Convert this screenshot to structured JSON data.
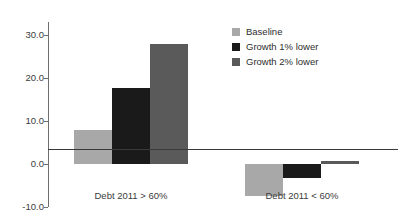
{
  "chart_data": {
    "type": "bar",
    "title": "",
    "subtitle": "",
    "xlabel": "",
    "ylabel": "",
    "categories": [
      "Debt 2011 > 60%",
      "Debt 2011 < 60%"
    ],
    "series": [
      {
        "name": "Baseline",
        "color": "#a8a8a8",
        "values": [
          8.0,
          -7.5
        ]
      },
      {
        "name": "Growth 1% lower",
        "color": "#1a1a1a",
        "values": [
          17.6,
          -3.2
        ]
      },
      {
        "name": "Growth 2% lower",
        "color": "#5a5a5a",
        "values": [
          27.8,
          0.7
        ]
      }
    ],
    "ylim": [
      -10.0,
      33.0
    ],
    "yticks": [
      30.0,
      20.0,
      10.0,
      0.0,
      -10.0
    ],
    "ytick_labels": [
      "30.0",
      "20.0",
      "10.0",
      "0.0",
      "-10.0"
    ],
    "grid": false,
    "legend_position": "top-right",
    "zero_line": true,
    "annotations": []
  },
  "legend": {
    "entries": [
      {
        "label": "Baseline"
      },
      {
        "label": "Growth 1% lower"
      },
      {
        "label": "Growth 2% lower"
      }
    ]
  },
  "axis": {
    "y_labels": [
      "30.0",
      "20.0",
      "10.0",
      "0.0",
      "-10.0"
    ],
    "x_labels": [
      "Debt 2011 > 60%",
      "Debt 2011 < 60%"
    ]
  }
}
